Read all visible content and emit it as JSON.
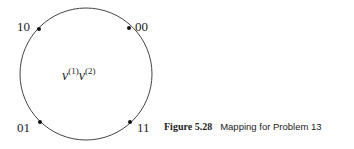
{
  "diagram": {
    "center_label": {
      "base1": "v",
      "sup1": "(1)",
      "base2": "v",
      "sup2": "(2)"
    },
    "points": [
      {
        "label": "10",
        "position": "upper-left"
      },
      {
        "label": "00",
        "position": "upper-right"
      },
      {
        "label": "01",
        "position": "lower-left"
      },
      {
        "label": "11",
        "position": "lower-right"
      }
    ]
  },
  "caption": {
    "number": "Figure 5.28",
    "text": "Mapping for Problem 13"
  }
}
